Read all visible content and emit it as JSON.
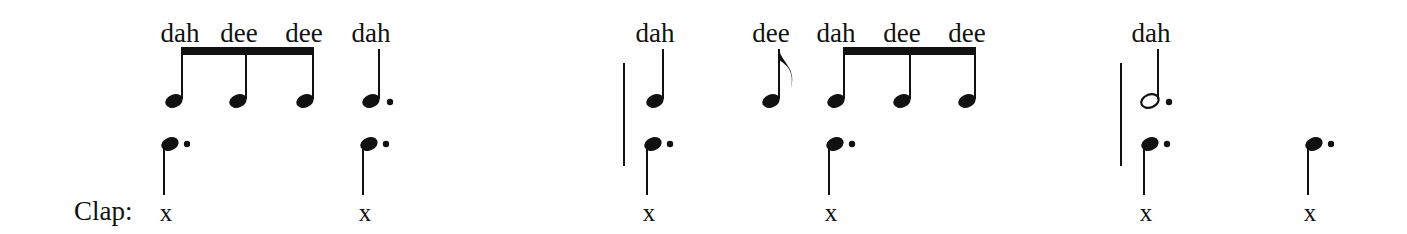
{
  "clap_label": "Clap:",
  "clap_mark": "x",
  "colors": {
    "ink": "#111111",
    "background": "#ffffff"
  },
  "measures": [
    {
      "index": 1,
      "syllables": [
        {
          "text": "dah",
          "x": 180
        },
        {
          "text": "dee",
          "x": 239
        },
        {
          "text": "dee",
          "x": 304
        },
        {
          "text": "dah",
          "x": 371
        }
      ],
      "rhythm_notes": [
        {
          "type": "eighth",
          "beamed": true,
          "x": 174
        },
        {
          "type": "eighth",
          "beamed": true,
          "x": 238
        },
        {
          "type": "eighth",
          "beamed": true,
          "x": 305
        },
        {
          "type": "dotted-quarter",
          "x": 371
        }
      ],
      "beat_notes": [
        {
          "type": "dotted-quarter",
          "x": 170,
          "clap": "x"
        },
        {
          "type": "dotted-quarter",
          "x": 369,
          "clap": "x"
        }
      ]
    },
    {
      "index": 2,
      "syllables": [
        {
          "text": "dah",
          "x": 655
        },
        {
          "text": "dee",
          "x": 771
        },
        {
          "text": "dah",
          "x": 836
        },
        {
          "text": "dee",
          "x": 902
        },
        {
          "text": "dee",
          "x": 967
        }
      ],
      "rhythm_notes": [
        {
          "type": "quarter",
          "x": 655
        },
        {
          "type": "eighth",
          "x": 771
        },
        {
          "type": "eighth",
          "beamed": true,
          "x": 836
        },
        {
          "type": "eighth",
          "beamed": true,
          "x": 902
        },
        {
          "type": "eighth",
          "beamed": true,
          "x": 967
        }
      ],
      "beat_notes": [
        {
          "type": "dotted-quarter",
          "x": 653,
          "clap": "x"
        },
        {
          "type": "dotted-quarter",
          "x": 835,
          "clap": "x"
        }
      ]
    },
    {
      "index": 3,
      "syllables": [
        {
          "text": "dah",
          "x": 1151
        }
      ],
      "rhythm_notes": [
        {
          "type": "dotted-half",
          "x": 1150
        }
      ],
      "beat_notes": [
        {
          "type": "dotted-quarter",
          "x": 1150,
          "clap": "x"
        },
        {
          "type": "dotted-quarter",
          "x": 1314,
          "clap": "x"
        }
      ]
    }
  ]
}
